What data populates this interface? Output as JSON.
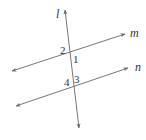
{
  "diagram": {
    "type": "transversal-parallel-lines",
    "colors": {
      "line": "#777777",
      "text": "#333333",
      "background": "#ffffff"
    },
    "lines": [
      {
        "id": "l",
        "label": "l",
        "x1": 65,
        "y1": 10,
        "x2": 79,
        "y2": 128,
        "label_x": 56,
        "label_y": 18
      },
      {
        "id": "m",
        "label": "m",
        "x1": 12,
        "y1": 71,
        "x2": 125,
        "y2": 34,
        "label_x": 130,
        "label_y": 37
      },
      {
        "id": "n",
        "label": "n",
        "x1": 16,
        "y1": 106,
        "x2": 128,
        "y2": 68,
        "label_x": 135,
        "label_y": 71
      }
    ],
    "angles": [
      {
        "label": "2",
        "x": 60,
        "y": 54
      },
      {
        "label": "1",
        "x": 73,
        "y": 63
      },
      {
        "label": "4",
        "x": 64,
        "y": 86
      },
      {
        "label": "3",
        "x": 74,
        "y": 83
      }
    ]
  }
}
